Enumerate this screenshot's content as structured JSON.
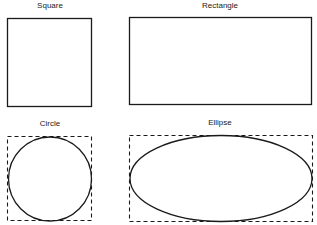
{
  "shapes": {
    "square": {
      "label": "Square"
    },
    "rectangle": {
      "label": "Rectangle"
    },
    "circle": {
      "label": "Circle"
    },
    "ellipse": {
      "label": "Ellipse"
    }
  },
  "colors": {
    "stroke": "#1a1a1a",
    "background": "#ffffff"
  }
}
